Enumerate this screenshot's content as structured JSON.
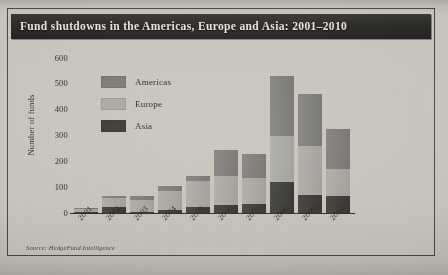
{
  "figure": {
    "title": "Fund shutdowns in the Americas, Europe and Asia: 2001–2010",
    "source": "Source: HedgeFund Intelligence",
    "caption": ""
  },
  "chart_data": {
    "type": "bar",
    "stacked": true,
    "title": "Fund shutdowns in the Americas, Europe and Asia: 2001–2010",
    "xlabel": "",
    "ylabel": "Number of funds",
    "ylim": [
      0,
      600
    ],
    "yticks": [
      600,
      500,
      400,
      300,
      200,
      100,
      0
    ],
    "grid": false,
    "legend_position": "upper-left-inside",
    "categories": [
      "2001",
      "2002",
      "2003",
      "2004",
      "2005",
      "2006",
      "2007",
      "2008",
      "2009",
      "2010"
    ],
    "series": [
      {
        "name": "Asia",
        "color": "#35342f",
        "values": [
          5,
          25,
          5,
          10,
          25,
          30,
          35,
          120,
          70,
          65
        ]
      },
      {
        "name": "Europe",
        "color": "#a9a7a0",
        "values": [
          10,
          35,
          45,
          75,
          100,
          115,
          100,
          180,
          190,
          105
        ]
      },
      {
        "name": "Americas",
        "color": "#7a7873",
        "values": [
          5,
          5,
          15,
          20,
          20,
          100,
          95,
          230,
          200,
          155
        ]
      }
    ],
    "totals": [
      20,
      65,
      65,
      105,
      145,
      245,
      230,
      530,
      460,
      325
    ]
  },
  "legend": {
    "items": [
      {
        "label": "Americas",
        "color": "#7a7873"
      },
      {
        "label": "Europe",
        "color": "#a9a7a0"
      },
      {
        "label": "Asia",
        "color": "#35342f"
      }
    ]
  }
}
